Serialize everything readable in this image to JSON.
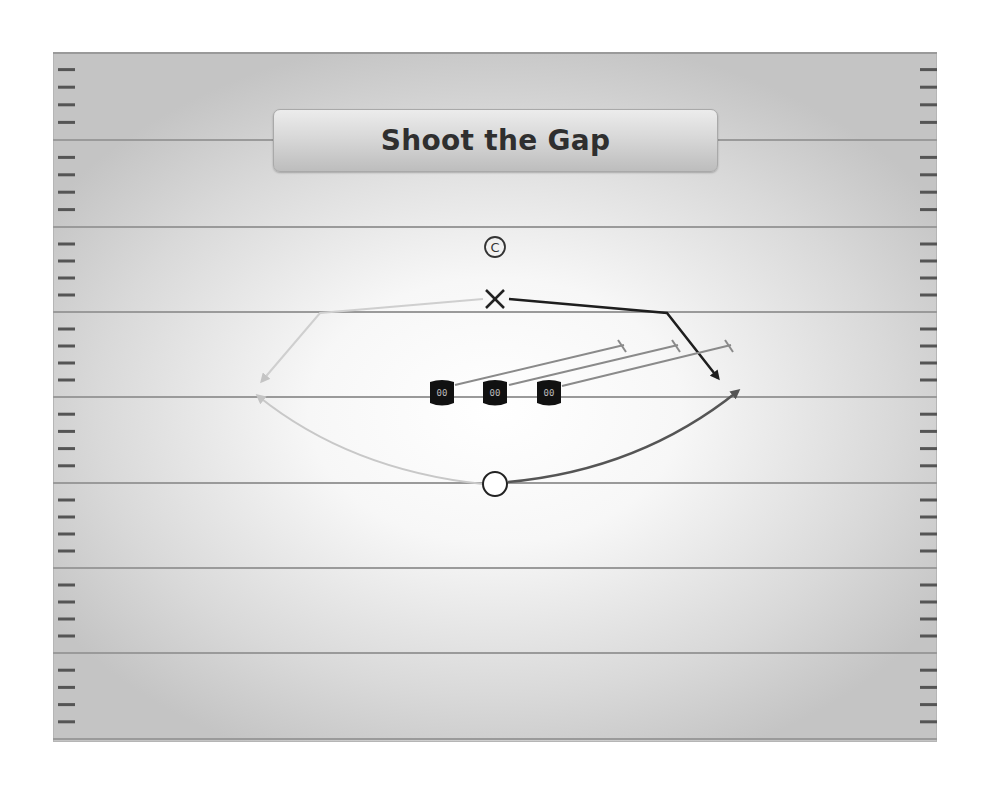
{
  "title": "Shoot the Gap",
  "colors": {
    "yard_line": "#9a9a9a",
    "hash_mark": "#555555",
    "dark_route": "#1e1e1e",
    "medium_route": "#555555",
    "light_route": "#c8c8c8",
    "block_line": "#8a8a8a",
    "lineman_fill": "#111111"
  },
  "players": {
    "center_marker": {
      "label": "C",
      "x": 495,
      "y": 248
    },
    "quarterback_x": {
      "label": "X",
      "x": 495,
      "y": 299
    },
    "running_back_o": {
      "label": "O",
      "x": 495,
      "y": 484
    },
    "linemen": [
      {
        "label": "00",
        "x": 442,
        "y": 393
      },
      {
        "label": "00",
        "x": 495,
        "y": 393
      },
      {
        "label": "00",
        "x": 549,
        "y": 393
      }
    ]
  },
  "field": {
    "yard_lines_y": [
      52,
      140,
      227,
      312,
      397,
      483,
      568,
      653,
      739
    ],
    "hash_left_x": 58,
    "hash_right_x": 920
  }
}
